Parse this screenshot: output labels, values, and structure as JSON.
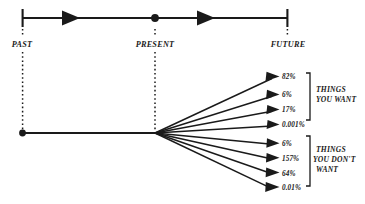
{
  "figure": {
    "type": "diagram",
    "background_color": "#ffffff",
    "ink_color": "#1a1a1a"
  },
  "timeline": {
    "axis": {
      "y": 18,
      "x_start": 22,
      "x_end": 288
    },
    "ticks": [
      {
        "id": "past",
        "label": "PAST",
        "x": 22
      },
      {
        "id": "present",
        "label": "PRESENT",
        "x": 155
      },
      {
        "id": "future",
        "label": "FUTURE",
        "x": 288
      }
    ],
    "arrowheads": [
      {
        "id": "arrow-past-to-present",
        "x": 75
      },
      {
        "id": "arrow-present-to-future",
        "x": 210
      }
    ],
    "present_marker": {
      "shape": "filled-circle",
      "x": 155,
      "y": 18
    },
    "label_y": 44
  },
  "trunk": {
    "origin_dot": {
      "x": 22,
      "y": 133
    },
    "fan_origin": {
      "x": 155,
      "y": 133
    }
  },
  "branches": {
    "tip_x": 278,
    "groups": [
      {
        "id": "things-you-want",
        "label": "THINGS YOU WANT",
        "label_lines": [
          "THINGS",
          "YOU WANT"
        ],
        "bracket": {
          "top": 73,
          "bottom": 120,
          "x": 302
        },
        "label_x": 313,
        "label_y": 92,
        "outcomes": [
          {
            "id": "want-1",
            "percent": "82%",
            "tip_y": 77
          },
          {
            "id": "want-2",
            "percent": "6%",
            "tip_y": 95
          },
          {
            "id": "want-3",
            "percent": "17%",
            "tip_y": 110
          },
          {
            "id": "want-4",
            "percent": "0.001%",
            "tip_y": 125
          }
        ]
      },
      {
        "id": "things-you-dont-want",
        "label": "THINGS YOU DON'T WANT",
        "label_lines": [
          "THINGS",
          "YOU DON'T",
          "WANT"
        ],
        "bracket": {
          "top": 136,
          "bottom": 186,
          "x": 302
        },
        "label_x": 313,
        "label_y": 150,
        "outcomes": [
          {
            "id": "dont-want-1",
            "percent": "6%",
            "tip_y": 143
          },
          {
            "id": "dont-want-2",
            "percent": "157%",
            "tip_y": 158
          },
          {
            "id": "dont-want-3",
            "percent": "64%",
            "tip_y": 173
          },
          {
            "id": "dont-want-4",
            "percent": "0.01%",
            "tip_y": 188
          }
        ]
      }
    ]
  }
}
